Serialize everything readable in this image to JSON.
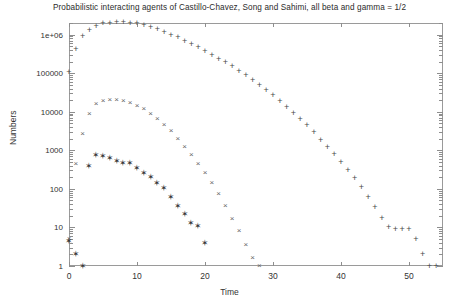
{
  "chart_data": {
    "type": "scatter",
    "title": "Probabilistic interacting agents of Castillo-Chavez, Song and Sahimi, all beta and gamma = 1/2",
    "xlabel": "Time",
    "ylabel": "Numbers",
    "xlim": [
      0,
      55
    ],
    "ylim": [
      1,
      2000000
    ],
    "yscale": "log",
    "xscale": "linear",
    "grid": false,
    "legend": "none",
    "xticks": [
      0,
      10,
      20,
      30,
      40,
      50
    ],
    "xticklabels": [
      "0",
      "10",
      "20",
      "30",
      "40",
      "50"
    ],
    "yticks": [
      1,
      10,
      100,
      1000,
      10000,
      100000,
      1000000
    ],
    "yticklabels": [
      "1",
      "10",
      "100",
      "1000",
      "10000",
      "100000",
      "1e+06"
    ],
    "series": [
      {
        "name": "plus-series",
        "marker": "+",
        "color": "#4a4a4a",
        "x": [
          0,
          1,
          2,
          3,
          4,
          5,
          6,
          7,
          8,
          9,
          10,
          11,
          12,
          13,
          14,
          15,
          16,
          17,
          18,
          19,
          20,
          21,
          22,
          23,
          24,
          25,
          26,
          27,
          28,
          29,
          30,
          31,
          32,
          33,
          34,
          35,
          36,
          37,
          38,
          39,
          40,
          41,
          42,
          43,
          44,
          45,
          46,
          47,
          48,
          49,
          50,
          51,
          52,
          53,
          54
        ],
        "y": [
          110000,
          430000,
          900000,
          1350000,
          1700000,
          1950000,
          2050000,
          2080000,
          2100000,
          2050000,
          1950000,
          1800000,
          1620000,
          1400000,
          1200000,
          1000000,
          850000,
          700000,
          580000,
          470000,
          380000,
          300000,
          240000,
          190000,
          150000,
          115000,
          88000,
          67000,
          50000,
          37000,
          27000,
          19000,
          13500,
          9500,
          6500,
          4400,
          2900,
          1900,
          1250,
          800,
          500,
          310,
          190,
          110,
          62,
          34,
          18,
          10,
          9,
          9,
          9,
          5,
          2,
          1,
          1
        ]
      },
      {
        "name": "cross-series",
        "marker": "x",
        "color": "#666666",
        "x": [
          0,
          1,
          2,
          3,
          4,
          5,
          6,
          7,
          8,
          9,
          10,
          11,
          12,
          13,
          14,
          15,
          16,
          17,
          18,
          19,
          20,
          21,
          22,
          23,
          24,
          25,
          26,
          27,
          28
        ],
        "y": [
          5,
          450,
          2600,
          9000,
          16000,
          19500,
          20500,
          20000,
          19000,
          17000,
          14500,
          11500,
          8800,
          6500,
          4600,
          3100,
          2000,
          1250,
          760,
          450,
          260,
          140,
          72,
          36,
          17,
          8,
          3.5,
          1.6,
          1
        ]
      },
      {
        "name": "star-series",
        "marker": "*",
        "color": "#3a3a3a",
        "x": [
          0,
          1,
          2,
          3,
          4,
          5,
          6,
          7,
          8,
          9,
          10,
          11,
          12,
          13,
          14,
          15,
          16,
          17,
          18,
          19,
          20
        ],
        "y": [
          4.5,
          2,
          1,
          390,
          760,
          700,
          650,
          520,
          480,
          470,
          350,
          260,
          200,
          145,
          105,
          60,
          36,
          22,
          13,
          11,
          4
        ]
      }
    ]
  }
}
